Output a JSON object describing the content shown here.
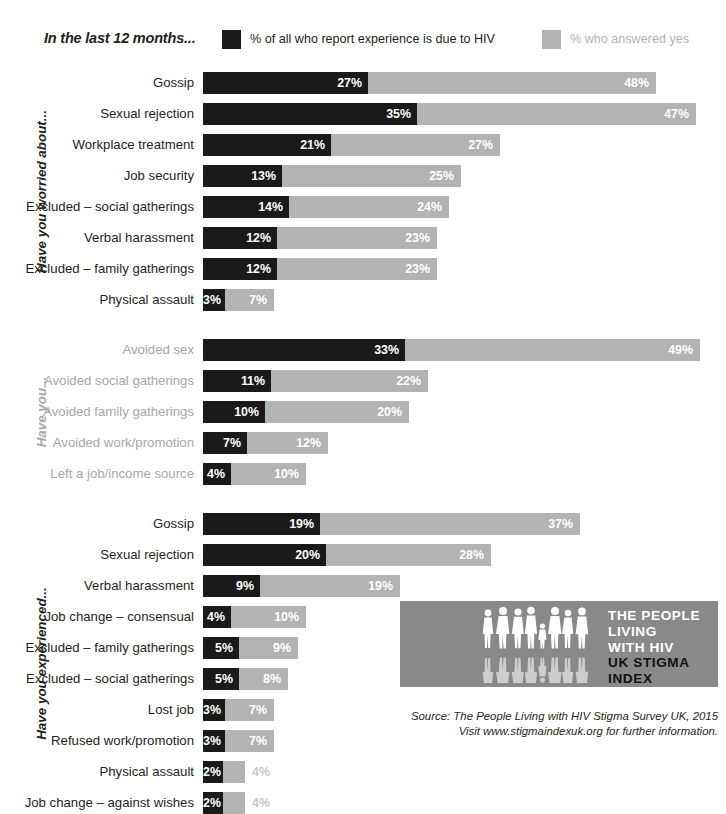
{
  "legend": {
    "title": "In the last 12 months...",
    "entries": [
      {
        "label": "% of all who report experience is due to HIV",
        "color": "#1a1a1a",
        "key": "due_to_hiv"
      },
      {
        "label": "% who answered yes",
        "color": "#b3b3b3",
        "key": "answered_yes"
      }
    ]
  },
  "groups": [
    {
      "label": "Have you worried about...",
      "muted": false
    },
    {
      "label": "Have you...",
      "muted": true
    },
    {
      "label": "Have you experienced...",
      "muted": false
    }
  ],
  "logo": {
    "lines": [
      {
        "text": "THE PEOPLE",
        "style": "white"
      },
      {
        "text": "LIVING",
        "style": "white"
      },
      {
        "text": "WITH HIV",
        "style": "white"
      },
      {
        "text": "UK STIGMA",
        "style": "black"
      },
      {
        "text": "INDEX",
        "style": "black"
      }
    ],
    "background": "#898989"
  },
  "source": {
    "line1": "Source: The People Living with HIV Stigma Survey UK, 2015",
    "line2": "Visit www.stigmaindexuk.org for further information."
  },
  "chart_data": {
    "type": "bar",
    "title": "In the last 12 months...",
    "xlabel": "",
    "ylabel": "",
    "orientation": "horizontal",
    "grid": false,
    "legend_position": "top",
    "series": [
      {
        "name": "% of all who report experience is due to HIV",
        "key": "due_to_hiv",
        "color": "#1a1a1a"
      },
      {
        "name": "% who answered yes",
        "key": "answered_yes",
        "color": "#b3b3b3"
      }
    ],
    "groups": [
      {
        "group": "Have you worried about...",
        "rows": [
          {
            "category": "Gossip",
            "due_to_hiv": 27,
            "answered_yes": 48,
            "dark_label": "27%",
            "gray_label": "48%",
            "dark_px": 165,
            "gray_px": 453
          },
          {
            "category": "Sexual rejection",
            "due_to_hiv": 35,
            "answered_yes": 47,
            "dark_label": "35%",
            "gray_label": "47%",
            "dark_px": 214,
            "gray_px": 493
          },
          {
            "category": "Workplace treatment",
            "due_to_hiv": 21,
            "answered_yes": 27,
            "dark_label": "21%",
            "gray_label": "27%",
            "dark_px": 128,
            "gray_px": 297
          },
          {
            "category": "Job security",
            "due_to_hiv": 13,
            "answered_yes": 25,
            "dark_label": "13%",
            "gray_label": "25%",
            "dark_px": 79,
            "gray_px": 258
          },
          {
            "category": "Excluded – social gatherings",
            "due_to_hiv": 14,
            "answered_yes": 24,
            "dark_label": "14%",
            "gray_label": "24%",
            "dark_px": 86,
            "gray_px": 246
          },
          {
            "category": "Verbal harassment",
            "due_to_hiv": 12,
            "answered_yes": 23,
            "dark_label": "12%",
            "gray_label": "23%",
            "dark_px": 74,
            "gray_px": 234
          },
          {
            "category": "Excluded – family gatherings",
            "due_to_hiv": 12,
            "answered_yes": 23,
            "dark_label": "12%",
            "gray_label": "23%",
            "dark_px": 74,
            "gray_px": 234
          },
          {
            "category": "Physical assault",
            "due_to_hiv": 3,
            "answered_yes": 7,
            "dark_label": "3%",
            "gray_label": "7%",
            "dark_px": 22,
            "gray_px": 71
          }
        ]
      },
      {
        "group": "Have you...",
        "rows": [
          {
            "category": "Avoided sex",
            "due_to_hiv": 33,
            "answered_yes": 49,
            "dark_label": "33%",
            "gray_label": "49%",
            "dark_px": 202,
            "gray_px": 497
          },
          {
            "category": "Avoided social gatherings",
            "due_to_hiv": 11,
            "answered_yes": 22,
            "dark_label": "11%",
            "gray_label": "22%",
            "dark_px": 68,
            "gray_px": 225
          },
          {
            "category": "Avoided family gatherings",
            "due_to_hiv": 10,
            "answered_yes": 20,
            "dark_label": "10%",
            "gray_label": "20%",
            "dark_px": 62,
            "gray_px": 206
          },
          {
            "category": "Avoided work/promotion",
            "due_to_hiv": 7,
            "answered_yes": 12,
            "dark_label": "7%",
            "gray_label": "12%",
            "dark_px": 44,
            "gray_px": 125
          },
          {
            "category": "Left a job/income source",
            "due_to_hiv": 4,
            "answered_yes": 10,
            "dark_label": "4%",
            "gray_label": "10%",
            "dark_px": 28,
            "gray_px": 103
          }
        ]
      },
      {
        "group": "Have you experienced...",
        "rows": [
          {
            "category": "Gossip",
            "due_to_hiv": 19,
            "answered_yes": 37,
            "dark_label": "19%",
            "gray_label": "37%",
            "dark_px": 117,
            "gray_px": 377
          },
          {
            "category": "Sexual rejection",
            "due_to_hiv": 20,
            "answered_yes": 28,
            "dark_label": "20%",
            "gray_label": "28%",
            "dark_px": 123,
            "gray_px": 288
          },
          {
            "category": "Verbal harassment",
            "due_to_hiv": 9,
            "answered_yes": 19,
            "dark_label": "9%",
            "gray_label": "19%",
            "dark_px": 57,
            "gray_px": 197
          },
          {
            "category": "Job change – consensual",
            "due_to_hiv": 4,
            "answered_yes": 10,
            "dark_label": "4%",
            "gray_label": "10%",
            "dark_px": 28,
            "gray_px": 103
          },
          {
            "category": "Excluded – family gatherings",
            "due_to_hiv": 5,
            "answered_yes": 9,
            "dark_label": "5%",
            "gray_label": "9%",
            "dark_px": 36,
            "gray_px": 95
          },
          {
            "category": "Excluded – social gatherings",
            "due_to_hiv": 5,
            "answered_yes": 8,
            "dark_label": "5%",
            "gray_label": "8%",
            "dark_px": 36,
            "gray_px": 85
          },
          {
            "category": "Lost job",
            "due_to_hiv": 3,
            "answered_yes": 7,
            "dark_label": "3%",
            "gray_label": "7%",
            "dark_px": 22,
            "gray_px": 71
          },
          {
            "category": "Refused work/promotion",
            "due_to_hiv": 3,
            "answered_yes": 7,
            "dark_label": "3%",
            "gray_label": "7%",
            "dark_px": 22,
            "gray_px": 71
          },
          {
            "category": "Physical assault",
            "due_to_hiv": 2,
            "answered_yes": 4,
            "dark_label": "2%",
            "gray_label": "4%",
            "dark_px": 20,
            "gray_px": 42,
            "gray_label_outside": true
          },
          {
            "category": "Job change – against wishes",
            "due_to_hiv": 2,
            "answered_yes": 4,
            "dark_label": "2%",
            "gray_label": "4%",
            "dark_px": 20,
            "gray_px": 42,
            "gray_label_outside": true
          }
        ]
      }
    ]
  }
}
